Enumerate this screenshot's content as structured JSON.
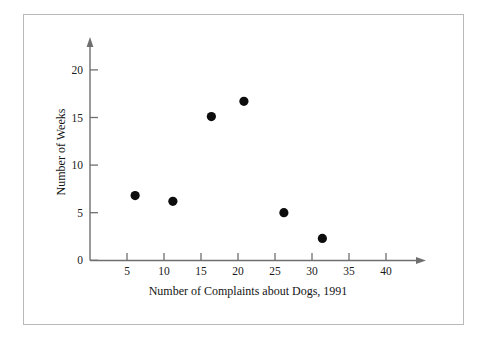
{
  "figure": {
    "frame_color": "#b9b9b9",
    "background": "#ffffff",
    "axis_color": "#6f6f6f",
    "point_color": "#0d0d0d"
  },
  "chart_data": {
    "type": "scatter",
    "title": "",
    "xlabel": "Number of Complaints about Dogs, 1991",
    "ylabel": "Number of Weeks",
    "xlim": [
      0,
      45
    ],
    "ylim": [
      0,
      22
    ],
    "grid": false,
    "legend": null,
    "x_ticks": [
      5,
      10,
      15,
      20,
      25,
      30,
      35,
      40
    ],
    "x_tick_labels": [
      "5",
      "10",
      "15",
      "20",
      "25",
      "30",
      "35",
      "40"
    ],
    "y_ticks": [
      0,
      5,
      10,
      15,
      20
    ],
    "y_tick_labels": [
      "0",
      "5",
      "10",
      "15",
      "20"
    ],
    "points": [
      {
        "x": 6.1,
        "y": 6.8
      },
      {
        "x": 11.2,
        "y": 6.2
      },
      {
        "x": 16.4,
        "y": 15.1
      },
      {
        "x": 20.8,
        "y": 16.7
      },
      {
        "x": 26.2,
        "y": 5.0
      },
      {
        "x": 31.4,
        "y": 2.3
      }
    ],
    "marker": "filled-circle",
    "marker_size": 4.6
  }
}
